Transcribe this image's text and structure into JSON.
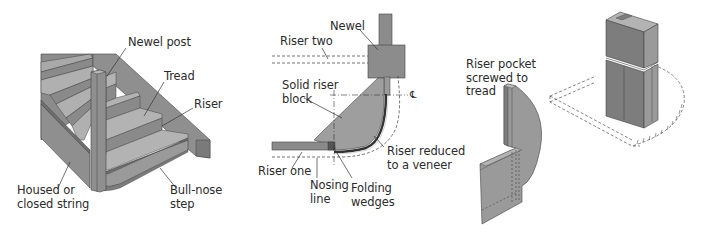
{
  "figure": {
    "panels": [
      {
        "id": "staircase-overview",
        "labels": {
          "newel_post": "Newel post",
          "tread": "Tread",
          "riser": "Riser",
          "housed_string": "Housed or\nclosed string",
          "bull_nose_step": "Bull-nose\nstep"
        }
      },
      {
        "id": "bull-nose-plan",
        "labels": {
          "newel": "Newel",
          "riser_two": "Riser two",
          "solid_riser_block": "Solid riser\nblock",
          "riser_reduced": "Riser reduced\nto a veneer",
          "riser_one": "Riser one",
          "nosing_line": "Nosing\nline",
          "folding_wedges": "Folding\nwedges",
          "centre_line_symbol": "℄"
        }
      },
      {
        "id": "riser-pocket-detail",
        "labels": {
          "riser_pocket": "Riser pocket\nscrewed to\ntread"
        }
      }
    ],
    "colors": {
      "dark_gray": "#7d7d7d",
      "mid_gray": "#9a9a9a",
      "light_gray": "#b3b3b3",
      "line": "#3a3a3a",
      "text": "#2b2b2b"
    }
  }
}
